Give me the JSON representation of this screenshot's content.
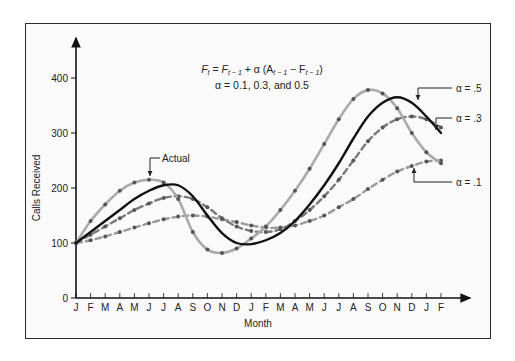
{
  "chart_data": {
    "type": "line",
    "title": "",
    "annotations": {
      "formula": "F_t = F_{t-1} + α (A_{t-1} − F_{t-1})",
      "formula_line2": "α = 0.1, 0.3, and 0.5",
      "actual_label": "Actual",
      "alpha_labels": [
        "α = .5",
        "α = .3",
        "α = .1"
      ]
    },
    "xlabel": "Month",
    "ylabel": "Calls Received",
    "ylim": [
      0,
      400
    ],
    "yticks": [
      0,
      100,
      200,
      300,
      400
    ],
    "categories": [
      "J",
      "F",
      "M",
      "A",
      "M",
      "J",
      "J",
      "A",
      "S",
      "O",
      "N",
      "D",
      "J",
      "F",
      "M",
      "A",
      "M",
      "J",
      "J",
      "A",
      "S",
      "O",
      "N",
      "D",
      "J",
      "F"
    ],
    "grid": false,
    "legend": "inline annotations with arrows",
    "series": [
      {
        "name": "Actual",
        "style": "solid light gray",
        "color": "#a8a8a8",
        "values": [
          100,
          140,
          170,
          195,
          210,
          215,
          210,
          180,
          120,
          88,
          82,
          90,
          108,
          130,
          160,
          195,
          235,
          280,
          325,
          362,
          378,
          372,
          345,
          300,
          265,
          245
        ]
      },
      {
        "name": "α = .5",
        "style": "solid black",
        "color": "#111111",
        "values": [
          100,
          120,
          140,
          160,
          180,
          195,
          205,
          205,
          185,
          150,
          118,
          100,
          98,
          105,
          118,
          140,
          170,
          205,
          245,
          290,
          330,
          355,
          365,
          355,
          330,
          300
        ]
      },
      {
        "name": "α = .3",
        "style": "dashed gray with dots",
        "color": "#777777",
        "values": [
          100,
          115,
          130,
          145,
          160,
          172,
          182,
          185,
          180,
          165,
          145,
          130,
          122,
          120,
          125,
          140,
          160,
          185,
          215,
          250,
          285,
          310,
          325,
          330,
          325,
          310
        ]
      },
      {
        "name": "α = .1",
        "style": "dashed gray with dots",
        "color": "#999999",
        "values": [
          100,
          105,
          112,
          120,
          128,
          136,
          143,
          148,
          150,
          148,
          143,
          138,
          132,
          128,
          128,
          132,
          140,
          150,
          165,
          180,
          198,
          215,
          230,
          240,
          248,
          250
        ]
      }
    ]
  },
  "axis": {
    "ylabel": "Calls Received",
    "xlabel": "Month",
    "yticks": [
      "0",
      "100",
      "200",
      "300",
      "400"
    ]
  },
  "formula": {
    "line1_F": "F",
    "line1_t": "t",
    "line1_rest": " = F",
    "line2": "α = 0.1, 0.3, and 0.5"
  },
  "labels": {
    "actual": "Actual",
    "a5": "α = .5",
    "a3": "α = .3",
    "a1": "α = .1"
  }
}
